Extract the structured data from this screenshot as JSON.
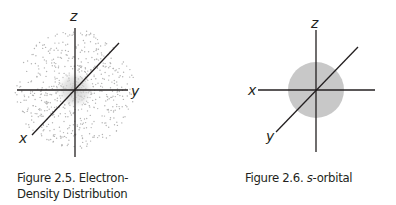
{
  "figures": [
    {
      "id": "fig-2-5",
      "caption_line1": "Figure 2.5. Electron-",
      "caption_line2": "Density Distribution",
      "axis_labels": {
        "z": "z",
        "y": "y",
        "x": "x"
      },
      "depiction": "diffuse dotted electron cloud, denser near origin"
    },
    {
      "id": "fig-2-6",
      "caption_prefix": "Figure 2.6. ",
      "caption_italic": "s",
      "caption_suffix": "-orbital",
      "axis_labels": {
        "z": "z",
        "x": "x",
        "y": "y"
      },
      "depiction": "solid gray sphere centered at origin"
    }
  ],
  "colors": {
    "axis": "#231f20",
    "cloud": "#b3b3b3",
    "sphere": "#c8c8c8"
  }
}
